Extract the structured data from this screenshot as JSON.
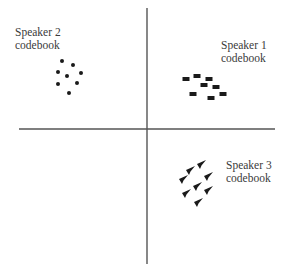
{
  "diagram": {
    "type": "scatter-codebook",
    "axes": {
      "vertical": {
        "x": 147,
        "y1": 8,
        "y2": 264
      },
      "horizontal": {
        "y": 129,
        "x1": 19,
        "x2": 275
      },
      "color": "#555555"
    },
    "labels": {
      "speaker1": {
        "line1": "Speaker 1",
        "line2": "codebook"
      },
      "speaker2": {
        "line1": "Speaker 2",
        "line2": "codebook"
      },
      "speaker3": {
        "line1": "Speaker 3",
        "line2": "codebook"
      }
    },
    "clusters": [
      {
        "name": "Speaker 1 codebook",
        "quadrant": "upper-right",
        "marker": "rectangle",
        "points": [
          [
            209,
            79
          ],
          [
            197,
            76
          ],
          [
            186,
            79
          ],
          [
            204,
            85
          ],
          [
            216,
            87
          ],
          [
            193,
            94
          ],
          [
            223,
            94
          ],
          [
            211,
            98
          ]
        ]
      },
      {
        "name": "Speaker 2 codebook",
        "quadrant": "upper-left",
        "marker": "dot",
        "points": [
          [
            62,
            61
          ],
          [
            73,
            65
          ],
          [
            58,
            72
          ],
          [
            67,
            76
          ],
          [
            81,
            73
          ],
          [
            58,
            84
          ],
          [
            77,
            83
          ],
          [
            69,
            93
          ]
        ]
      },
      {
        "name": "Speaker 3 codebook",
        "quadrant": "lower-right",
        "marker": "triangle",
        "points": [
          [
            201,
            165
          ],
          [
            190,
            171
          ],
          [
            183,
            180
          ],
          [
            208,
            177
          ],
          [
            197,
            187
          ],
          [
            186,
            194
          ],
          [
            208,
            191
          ],
          [
            198,
            203
          ]
        ]
      }
    ],
    "marker_color": "#1a1a1a"
  }
}
